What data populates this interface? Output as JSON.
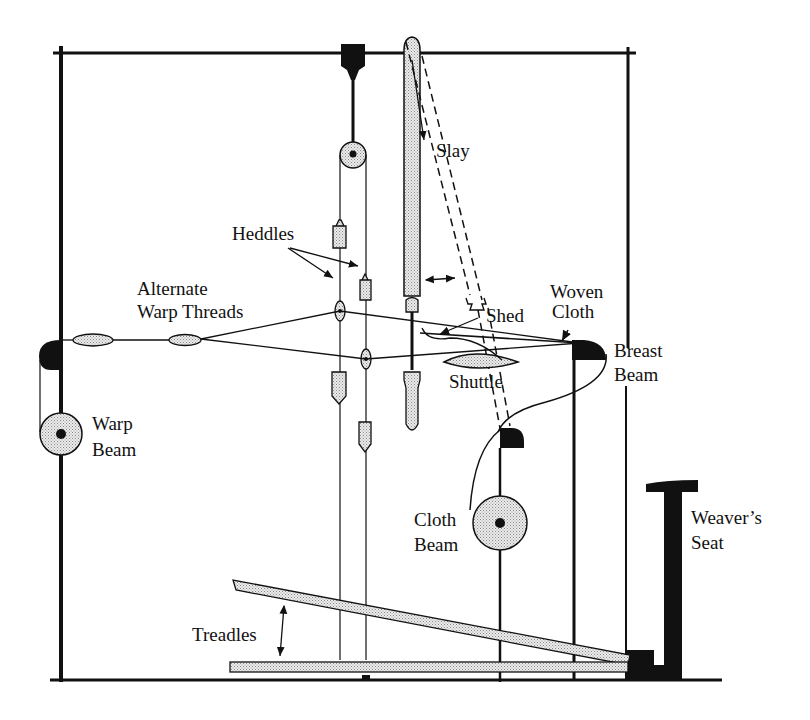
{
  "diagram": {
    "colors": {
      "ink": "#111111",
      "stipple": "#d9d9d9",
      "background": "#ffffff"
    },
    "labels": {
      "heddles": "Heddles",
      "alternate_warp_1": "Alternate",
      "alternate_warp_2": "Warp Threads",
      "slay": "Slay",
      "shed": "Shed",
      "woven_cloth_1": "Woven",
      "woven_cloth_2": "Cloth",
      "breast_beam_1": "Breast",
      "breast_beam_2": "Beam",
      "shuttle": "Shuttle",
      "warp_beam_1": "Warp",
      "warp_beam_2": "Beam",
      "cloth_beam_1": "Cloth",
      "cloth_beam_2": "Beam",
      "weavers_seat_1": "Weaver’s",
      "weavers_seat_2": "Seat",
      "treadles": "Treadles"
    }
  }
}
